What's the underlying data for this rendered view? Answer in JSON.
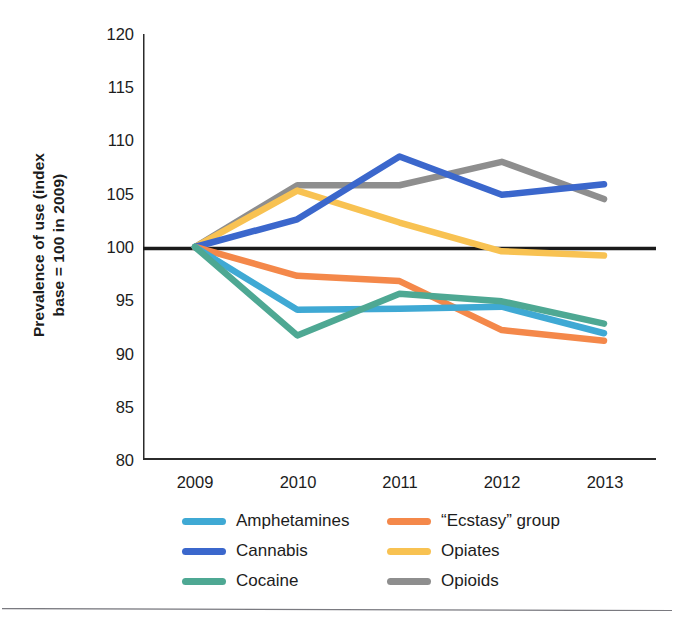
{
  "chart_data": {
    "type": "line",
    "title": "",
    "subtitle": "",
    "xlabel": "",
    "ylabel": "Prevalence of use (index base = 100 in 2009)",
    "ylabel_lines": [
      "Prevalence of use (index",
      "base = 100 in 2009)"
    ],
    "x": [
      "2009",
      "2010",
      "2011",
      "2012",
      "2013"
    ],
    "categories": [
      "2009",
      "2010",
      "2011",
      "2012",
      "2013"
    ],
    "xlim": [
      2009,
      2013
    ],
    "ylim": [
      80,
      120
    ],
    "yticks": [
      120,
      115,
      110,
      105,
      100,
      95,
      90,
      85,
      80
    ],
    "ytick_labels": [
      "120",
      "115",
      "110",
      "105",
      "100",
      "95",
      "90",
      "85",
      "80"
    ],
    "xtick_labels": [
      "2009",
      "2010",
      "2011",
      "2012",
      "2013"
    ],
    "grid": false,
    "legend_position": "bottom",
    "reference_line": {
      "value": 100,
      "color": "#1a1a1a",
      "label": "index base = 100"
    },
    "series": [
      {
        "name": "Amphetamines",
        "color": "#3FA9D4",
        "values": [
          100,
          94.1,
          94.2,
          94.4,
          91.9
        ]
      },
      {
        "name": "Cannabis",
        "color": "#3B67CC",
        "values": [
          100,
          102.6,
          108.5,
          104.9,
          105.9
        ]
      },
      {
        "name": "Cocaine",
        "color": "#4EA893",
        "values": [
          100,
          91.7,
          95.6,
          94.9,
          92.8
        ]
      },
      {
        "name": "“Ecstasy” group",
        "color": "#F4884A",
        "values": [
          100,
          97.3,
          96.8,
          92.2,
          91.2
        ]
      },
      {
        "name": "Opiates",
        "color": "#F8C252",
        "values": [
          100,
          105.3,
          102.3,
          99.6,
          99.2
        ]
      },
      {
        "name": "Opioids",
        "color": "#8E8E8E",
        "values": [
          100,
          105.8,
          105.8,
          108.0,
          104.5
        ]
      }
    ]
  },
  "legend": {
    "items": [
      {
        "label": "Amphetamines",
        "color": "#3FA9D4",
        "swatch_name": "legend-swatch-amphetamines"
      },
      {
        "label": "“Ecstasy” group",
        "color": "#F4884A",
        "swatch_name": "legend-swatch-ecstasy-group"
      },
      {
        "label": "Cannabis",
        "color": "#3B67CC",
        "swatch_name": "legend-swatch-cannabis"
      },
      {
        "label": "Opiates",
        "color": "#F8C252",
        "swatch_name": "legend-swatch-opiates"
      },
      {
        "label": "Cocaine",
        "color": "#4EA893",
        "swatch_name": "legend-swatch-cocaine"
      },
      {
        "label": "Opioids",
        "color": "#8E8E8E",
        "swatch_name": "legend-swatch-opioids"
      }
    ]
  },
  "axis": {
    "y_title_line1": "Prevalence of use (index",
    "y_title_line2": "base = 100 in 2009)",
    "y_ticks": [
      "120",
      "115",
      "110",
      "105",
      "100",
      "95",
      "90",
      "85",
      "80"
    ],
    "x_ticks": [
      "2009",
      "2010",
      "2011",
      "2012",
      "2013"
    ]
  },
  "colors": {
    "axis": "#2b2b2b",
    "reference_line": "#1a1a1a",
    "text": "#1c1c1c",
    "background": "#ffffff",
    "page_rule": "#7a7a80"
  }
}
